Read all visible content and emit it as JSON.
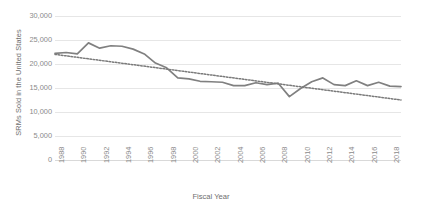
{
  "chart_data": {
    "type": "line",
    "title": "",
    "xlabel": "Fiscal Year",
    "ylabel": "SRMs Sold in the United States",
    "xlim": [
      1988,
      2019
    ],
    "ylim": [
      0,
      30000
    ],
    "grid": true,
    "legend": "none",
    "y_ticks": [
      "30,000",
      "25,000",
      "20,000",
      "15,000",
      "10,000",
      "5,000",
      "0"
    ],
    "y_tick_values": [
      30000,
      25000,
      20000,
      15000,
      10000,
      5000,
      0
    ],
    "x_ticks": [
      "1988",
      "1990",
      "1992",
      "1994",
      "1996",
      "1998",
      "2000",
      "2002",
      "2004",
      "2006",
      "2008",
      "2010",
      "2012",
      "2014",
      "2016",
      "2018"
    ],
    "x_tick_values": [
      1988,
      1990,
      1992,
      1994,
      1996,
      1998,
      2000,
      2002,
      2004,
      2006,
      2008,
      2010,
      2012,
      2014,
      2016,
      2018
    ],
    "series": [
      {
        "name": "SRMs Sold",
        "style": "solid",
        "color": "#808080",
        "x": [
          1988,
          1989,
          1990,
          1991,
          1992,
          1993,
          1994,
          1995,
          1996,
          1997,
          1998,
          1999,
          2000,
          2001,
          2002,
          2003,
          2004,
          2005,
          2006,
          2007,
          2008,
          2009,
          2010,
          2011,
          2012,
          2013,
          2014,
          2015,
          2016,
          2017,
          2018,
          2019
        ],
        "values": [
          22200,
          22400,
          22100,
          24400,
          23300,
          23800,
          23700,
          23100,
          22100,
          20200,
          19200,
          17100,
          16900,
          16400,
          16300,
          16200,
          15500,
          15500,
          16100,
          15700,
          16000,
          13200,
          14900,
          16300,
          17100,
          15700,
          15500,
          16500,
          15500,
          16200,
          15400,
          15300
        ]
      },
      {
        "name": "Linear Trendline",
        "style": "dotted",
        "color": "#7a7a7a",
        "x": [
          1988,
          2019
        ],
        "values": [
          22000,
          12500
        ]
      }
    ]
  }
}
